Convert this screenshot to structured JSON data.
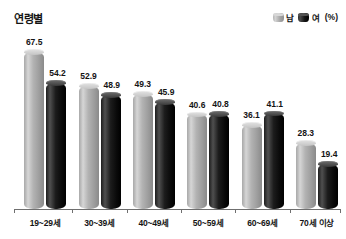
{
  "header": {
    "title": "연령별"
  },
  "legend": {
    "entries": [
      {
        "label": "남",
        "swatch": "male-cylinder-icon",
        "color": "#b3b3b3"
      },
      {
        "label": "여",
        "swatch": "female-cylinder-icon",
        "color": "#111111"
      }
    ],
    "unit": "(%)"
  },
  "chart_data": {
    "type": "bar",
    "title": "연령별",
    "xlabel": "",
    "ylabel": "",
    "unit": "(%)",
    "ylim": [
      0,
      75
    ],
    "grid": false,
    "legend_position": "top-right",
    "categories": [
      "19~29세",
      "30~39세",
      "40~49세",
      "50~59세",
      "60~69세",
      "70세 이상"
    ],
    "series": [
      {
        "name": "남",
        "color": "#b3b3b3",
        "values": [
          67.5,
          52.9,
          49.3,
          40.6,
          36.1,
          28.3
        ]
      },
      {
        "name": "여",
        "color": "#111111",
        "values": [
          54.2,
          48.9,
          45.9,
          40.8,
          41.1,
          19.4
        ]
      }
    ]
  }
}
